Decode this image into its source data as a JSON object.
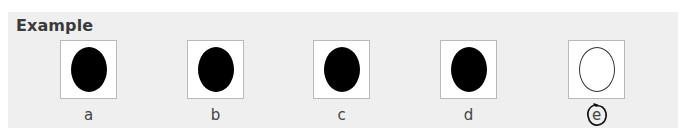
{
  "title": "Example",
  "options": [
    {
      "label": "a",
      "shape": "filled-oval"
    },
    {
      "label": "b",
      "shape": "filled-oval"
    },
    {
      "label": "c",
      "shape": "filled-oval"
    },
    {
      "label": "d",
      "shape": "filled-oval"
    },
    {
      "label": "e",
      "shape": "empty-oval",
      "circled": true
    }
  ],
  "colors": {
    "panel": "#efefef",
    "filled_oval": "#000000",
    "box_border": "#b9b9b9"
  }
}
